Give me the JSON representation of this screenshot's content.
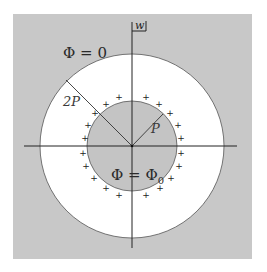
{
  "diagram": {
    "corner_label": "w",
    "outer_boundary_label": "Φ = 0",
    "inner_region_label_main": "Φ = Φ",
    "inner_region_label_sub": "0",
    "outer_radius_label": "2P",
    "inner_radius_label": "P",
    "charge_symbol": "+",
    "charge_count": 20,
    "colors": {
      "background_gray": "#c8c8c8",
      "annulus": "#ffffff",
      "inner_disk": "#c4c4c4",
      "lines": "#222222"
    }
  }
}
